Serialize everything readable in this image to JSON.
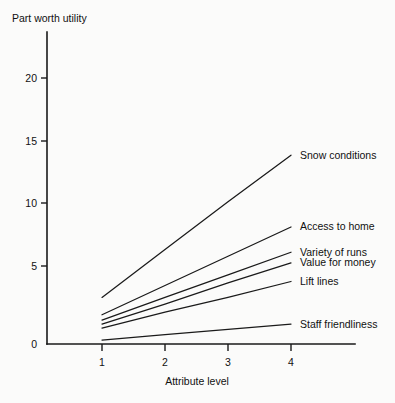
{
  "chart_data": {
    "type": "line",
    "title": "",
    "ylabel": "Part worth utility",
    "xlabel": "Attribute level",
    "categories": [
      1,
      2,
      3,
      4
    ],
    "x": [
      1,
      2,
      3,
      4
    ],
    "xlim": [
      1,
      4
    ],
    "ylim": [
      0,
      23
    ],
    "yticks": [
      0,
      5,
      10,
      15,
      20
    ],
    "xticks": [
      1,
      2,
      3,
      4
    ],
    "ytick_labels": [
      "0",
      "5",
      "10",
      "15",
      "20"
    ],
    "xtick_labels": [
      "1",
      "2",
      "3",
      "4"
    ],
    "grid": false,
    "legend_position": "right-inline-labels",
    "series": [
      {
        "name": "Snow conditions",
        "values": [
          3.5,
          7.1,
          10.7,
          14.2
        ]
      },
      {
        "name": "Access to home",
        "values": [
          2.2,
          4.4,
          6.6,
          8.8
        ]
      },
      {
        "name": "Variety of runs",
        "values": [
          1.8,
          3.5,
          5.2,
          6.9
        ]
      },
      {
        "name": "Value for money",
        "values": [
          1.5,
          3.0,
          4.6,
          6.1
        ]
      },
      {
        "name": "Lift lines",
        "values": [
          1.2,
          2.4,
          3.5,
          4.7
        ]
      },
      {
        "name": "Staff friendliness",
        "values": [
          0.3,
          0.7,
          1.1,
          1.5
        ]
      }
    ],
    "colors": {
      "line": "#1a1a1a",
      "axis": "#1a1a1a",
      "background": "#fbfbfa"
    }
  },
  "labels": {
    "y_axis_title": "Part worth utility",
    "x_axis_title": "Attribute level",
    "y_ticks": [
      "20",
      "15",
      "10",
      "5",
      "0"
    ],
    "x_ticks": [
      "1",
      "2",
      "3",
      "4"
    ],
    "series_names": [
      "Snow conditions",
      "Access to home",
      "Variety of runs",
      "Value for money",
      "Lift lines",
      "Staff friendliness"
    ]
  }
}
